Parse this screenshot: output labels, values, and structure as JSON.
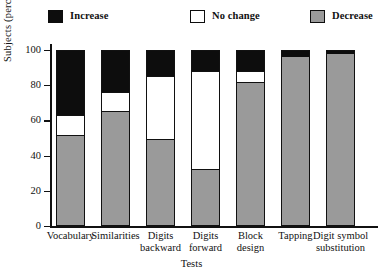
{
  "chart_data": {
    "type": "bar",
    "variant": "stacked-vertical-100",
    "title": "",
    "xlabel": "Tests",
    "ylabel": "Subjects (percent)",
    "ylim": [
      0,
      100
    ],
    "yticks": [
      0,
      20,
      40,
      60,
      80,
      100
    ],
    "grid": false,
    "legend_position": "top",
    "categories": [
      "Vocabulary",
      "Similarities",
      "Digits backward",
      "Digits forward",
      "Block design",
      "Tapping",
      "Digit symbol substitution"
    ],
    "category_lines": [
      [
        "Vocabulary"
      ],
      [
        "Similarities"
      ],
      [
        "Digits",
        "backward"
      ],
      [
        "Digits",
        "forward"
      ],
      [
        "Block",
        "design"
      ],
      [
        "Tapping"
      ],
      [
        "Digit symbol",
        "substitution"
      ]
    ],
    "series": [
      {
        "name": "Decrease",
        "color": "#9a9a9a",
        "values": [
          51,
          65,
          49,
          32,
          81,
          96,
          98
        ]
      },
      {
        "name": "No change",
        "color": "#ffffff",
        "values": [
          12,
          11,
          36,
          56,
          7,
          0,
          0
        ]
      },
      {
        "name": "Increase",
        "color": "#0d0d0d",
        "values": [
          37,
          24,
          15,
          12,
          12,
          4,
          2
        ]
      }
    ]
  },
  "legend": {
    "items": [
      {
        "label": "Increase",
        "swatch": "swatch-increase-black"
      },
      {
        "label": "No change",
        "swatch": "swatch-no-change-white"
      },
      {
        "label": "Decrease",
        "swatch": "swatch-decrease-gray"
      }
    ]
  },
  "axes": {
    "y_title": "Subjects (percent)",
    "x_title": "Tests",
    "y_ticks": [
      "100",
      "80",
      "60",
      "40",
      "20",
      "0"
    ]
  },
  "colors": {
    "increase": "#0d0d0d",
    "no_change": "#ffffff",
    "decrease": "#9a9a9a",
    "axis": "#111111",
    "background": "#ffffff"
  }
}
